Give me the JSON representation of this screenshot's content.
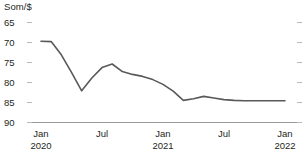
{
  "chart_data": {
    "type": "line",
    "title": "",
    "unit_label": "Som/$",
    "ylabel": "Som/$",
    "xlabel": "",
    "grid": true,
    "legend": "none",
    "y_axis_inverted": true,
    "ylim": [
      65,
      90
    ],
    "y_ticks": [
      65,
      70,
      75,
      80,
      85,
      90
    ],
    "x_tick_labels": [
      "Jan",
      "Jul",
      "Jan",
      "Jul",
      "Jan"
    ],
    "x_tick_years": [
      "2020",
      "",
      "2021",
      "",
      "2022"
    ],
    "x_range": [
      "2020-01",
      "2022-01"
    ],
    "series": [
      {
        "name": "Som per US dollar",
        "color": "#58595b",
        "x": [
          "2020-01",
          "2020-02",
          "2020-03",
          "2020-04",
          "2020-05",
          "2020-06",
          "2020-07",
          "2020-08",
          "2020-09",
          "2020-10",
          "2020-11",
          "2020-12",
          "2021-01",
          "2021-02",
          "2021-03",
          "2021-04",
          "2021-05",
          "2021-06",
          "2021-07",
          "2021-08",
          "2021-09",
          "2021-10",
          "2021-11",
          "2021-12",
          "2022-01"
        ],
        "values": [
          69.8,
          69.9,
          73.2,
          77.6,
          82.2,
          79.0,
          76.4,
          75.5,
          77.4,
          78.1,
          78.6,
          79.4,
          80.6,
          82.3,
          84.6,
          84.2,
          83.6,
          84.0,
          84.4,
          84.6,
          84.7,
          84.7,
          84.7,
          84.7,
          84.7
        ]
      }
    ]
  }
}
